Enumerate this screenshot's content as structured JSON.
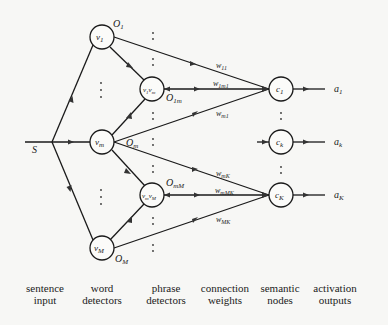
{
  "diagram": {
    "input": {
      "label": "S"
    },
    "word_detectors": [
      {
        "id": "v1",
        "label": "v",
        "sub": "1",
        "output": "O",
        "output_sub": "1"
      },
      {
        "id": "vm",
        "label": "v",
        "sub": "m",
        "output": "O",
        "output_sub": "m"
      },
      {
        "id": "vM",
        "label": "v",
        "sub": "M",
        "output": "O",
        "output_sub": "M"
      }
    ],
    "phrase_detectors": [
      {
        "id": "v1vm",
        "label": "v₁vₘ",
        "output": "O",
        "output_sub": "1m"
      },
      {
        "id": "vmvM",
        "label": "vₘvₘ",
        "output": "O",
        "output_sub": "mM"
      }
    ],
    "weights": [
      {
        "label": "w",
        "sub": "11"
      },
      {
        "label": "w",
        "sub": "1m1"
      },
      {
        "label": "w",
        "sub": "m1"
      },
      {
        "label": "w",
        "sub": "mK"
      },
      {
        "label": "w",
        "sub": "mMK"
      },
      {
        "label": "w",
        "sub": "MK"
      }
    ],
    "semantic_nodes": [
      {
        "id": "c1",
        "label": "c",
        "sub": "1",
        "output": "a",
        "output_sub": "1"
      },
      {
        "id": "ck",
        "label": "c",
        "sub": "k",
        "output": "a",
        "output_sub": "k"
      },
      {
        "id": "cK",
        "label": "c",
        "sub": "K",
        "output": "a",
        "output_sub": "K"
      }
    ]
  },
  "column_labels": [
    {
      "line1": "sentence",
      "line2": "input"
    },
    {
      "line1": "word",
      "line2": "detectors"
    },
    {
      "line1": "phrase",
      "line2": "detectors"
    },
    {
      "line1": "connection",
      "line2": "weights"
    },
    {
      "line1": "semantic",
      "line2": "nodes"
    },
    {
      "line1": "activation",
      "line2": "outputs"
    }
  ]
}
